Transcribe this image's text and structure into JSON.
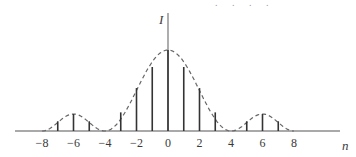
{
  "chart_data": {
    "type": "stem",
    "title": "",
    "xlabel": "n",
    "ylabel": "I",
    "x": [
      -8,
      -7,
      -6,
      -5,
      -4,
      -3,
      -2,
      -1,
      0,
      1,
      2,
      3,
      4,
      5,
      6,
      7,
      8
    ],
    "values": [
      0,
      0.12,
      0.21,
      0.12,
      0,
      0.23,
      0.53,
      0.79,
      1.0,
      0.79,
      0.53,
      0.23,
      0,
      0.12,
      0.21,
      0.12,
      0
    ],
    "envelope": "dashed",
    "xticks": [
      -8,
      -6,
      -4,
      -2,
      0,
      2,
      4,
      6,
      8
    ],
    "xtick_labels": [
      "−8",
      "−6",
      "−4",
      "−2",
      "0",
      "2",
      "4",
      "6",
      "8"
    ],
    "xlim": [
      -9.6,
      10.9
    ],
    "ylim": [
      0,
      1.0
    ],
    "grid": false,
    "legend": null
  },
  "decoration": {
    "top_dots": ". . . ."
  },
  "colors": {
    "stem": "#333333",
    "axis": "#555555",
    "envelope": "#666666"
  }
}
